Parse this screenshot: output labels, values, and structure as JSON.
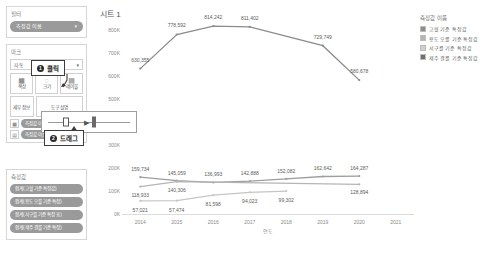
{
  "sidebar": {
    "filters": {
      "title": "필터",
      "pills": [
        {
          "label": "측정값 이름",
          "icon": "▾"
        }
      ]
    },
    "marks": {
      "title": "마크",
      "type_label": "자동",
      "type_icon": "▾",
      "buttons": [
        {
          "label": "색상",
          "icon": "color-icon",
          "glyph": "▦"
        },
        {
          "label": "크기",
          "icon": "size-icon",
          "glyph": "◌"
        },
        {
          "label": "레이블",
          "icon": "label-icon",
          "glyph": "▤"
        },
        {
          "label": "세부 정보",
          "icon": "detail-icon",
          "glyph": "▩"
        },
        {
          "label": "도구 설명",
          "icon": "tooltip-icon",
          "glyph": "▭"
        },
        {
          "label": "경로",
          "icon": "path-icon",
          "glyph": "⌁"
        }
      ],
      "detail_pill": "측정값 이름",
      "path_pill": "측정값 이름"
    },
    "measures": {
      "title": "측정값",
      "pills": [
        "합계(고혈 기준 특정값)",
        "합계(용도 오를 기준 특정)",
        "합계(서구를 기준 특정 표)",
        "합계(제주 결를 기준 특정)"
      ]
    }
  },
  "main": {
    "title": "시트 1"
  },
  "legend": {
    "title": "측정값 이름",
    "items": [
      {
        "label": "고혈 기준 특정값",
        "color": "#8c8c8c"
      },
      {
        "label": "용도 오를 기준 특정값",
        "color": "#b5b5b5"
      },
      {
        "label": "서구를 기준 특정값",
        "color": "#cfcfcf"
      },
      {
        "label": "제주 결를 기준 특정값",
        "color": "#6f6f6f"
      }
    ]
  },
  "callouts": [
    {
      "num": "1",
      "text": "클릭"
    },
    {
      "num": "2",
      "text": "드래그"
    }
  ],
  "chart_data": {
    "type": "line",
    "title": "시트 1",
    "xlabel": "연도",
    "ylabel": "",
    "x": [
      2014,
      2015,
      2016,
      2017,
      2018,
      2019,
      2020,
      2021
    ],
    "ylim": [
      0,
      850000
    ],
    "yticks": [
      0,
      100000,
      200000,
      300000,
      400000,
      500000,
      600000,
      700000,
      800000
    ],
    "ytick_labels": [
      "0K",
      "100K",
      "200K",
      "300K",
      "400K",
      "500K",
      "600K",
      "700K",
      "800K"
    ],
    "xtick_labels": [
      "2014",
      "2015",
      "2016",
      "2017",
      "2018",
      "2019",
      "2020",
      "2021"
    ],
    "grid": false,
    "legend_position": "right",
    "series": [
      {
        "name": "고혈 기준 특정값",
        "color": "#8c8c8c",
        "values": [
          630355,
          778592,
          814242,
          811402,
          null,
          729749,
          580678,
          null
        ],
        "labels": [
          "630,355",
          "778,592",
          "814,242",
          "811,402",
          "",
          "729,749",
          "580,678",
          ""
        ]
      },
      {
        "name": "용도 오를 기준 특정값",
        "color": "#9e9e9e",
        "values": [
          159734,
          145059,
          136993,
          142888,
          152082,
          162642,
          164287,
          null
        ],
        "labels": [
          "159,734",
          "145,059",
          "136,993",
          "142,888",
          "152,082",
          "162,642",
          "164,287",
          ""
        ]
      },
      {
        "name": "서구를 기준 특정값",
        "color": "#b5b5b5",
        "values": [
          118933,
          140306,
          null,
          null,
          null,
          null,
          128894,
          null
        ],
        "labels": [
          "118,933",
          "140,306",
          "",
          "",
          "",
          "",
          "128,894",
          ""
        ]
      },
      {
        "name": "제주 결를 기준 특정값",
        "color": "#c6c6c6",
        "values": [
          57021,
          57474,
          81598,
          94023,
          99302,
          null,
          null,
          null
        ],
        "labels": [
          "57,021",
          "57,474",
          "81,598",
          "94,023",
          "99,302",
          "",
          "",
          ""
        ]
      }
    ]
  }
}
